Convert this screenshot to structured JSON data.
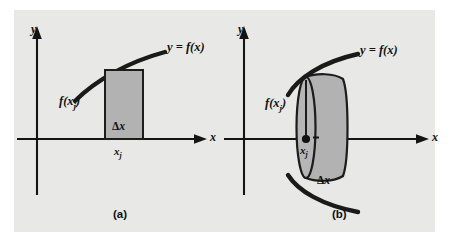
{
  "figure": {
    "background_color": "#ffffff",
    "panel_color": "#e8e8e6",
    "ink_color": "#141414",
    "shade_color": "#b2b2b2",
    "panels": [
      {
        "id": "a",
        "caption": "(a)",
        "axis_y_label": "y",
        "axis_x_label": "x",
        "curve_label": "y = f(x)",
        "height_label": "f(x",
        "height_label_sub": "j",
        "height_label_tail": ")",
        "point_label": "x",
        "point_label_sub": "j",
        "width_label_delta": "Δ",
        "width_label_var": "x",
        "region_type": "rectangle"
      },
      {
        "id": "b",
        "caption": "(b)",
        "axis_y_label": "y",
        "axis_x_label": "x",
        "curve_label": "y = f(x)",
        "height_label": "f(x",
        "height_label_sub": "j",
        "height_label_tail": ")",
        "point_label": "x",
        "point_label_sub": "j",
        "width_label_delta": "Δ",
        "width_label_var": "x",
        "region_type": "disk"
      }
    ]
  }
}
